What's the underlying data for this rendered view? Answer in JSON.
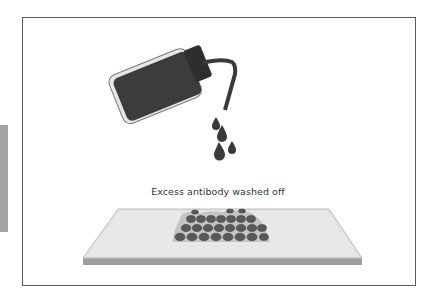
{
  "figure": {
    "caption": "Excess antibody washed off",
    "elements": {
      "wash_bottle": "wash-bottle-icon",
      "droplets": 4,
      "slide": "glass-slide",
      "tissue": "cell-tissue-section"
    },
    "colors": {
      "bottle_fill": "#3c3c3c",
      "bottle_outline": "#8a8a8a",
      "bottle_highlight": "#e6e6e6",
      "slide_top": "#e4e4e4",
      "slide_edge": "#9a9a9a",
      "cell_fill": "#555555",
      "tissue_bg": "#c8c8c8",
      "frame_border": "#5a5a5a",
      "side_tab": "#a3a3a3"
    }
  }
}
